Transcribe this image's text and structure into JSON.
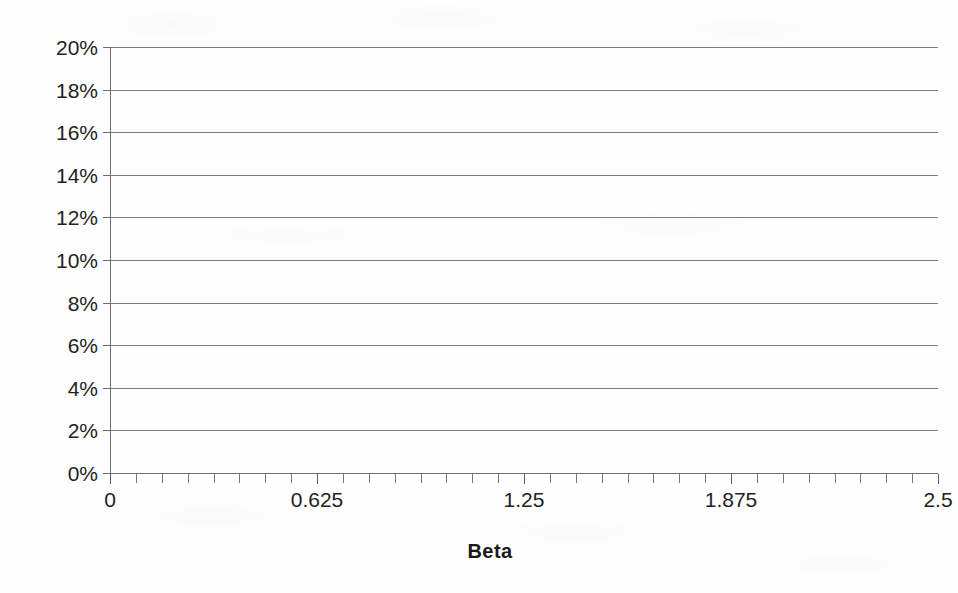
{
  "chart_data": {
    "type": "line",
    "title": "",
    "subtitle": "",
    "xlabel": "Beta",
    "ylabel": "",
    "xlim": [
      0,
      2.5
    ],
    "ylim": [
      0,
      0.2
    ],
    "grid": true,
    "grid_orientation": "horizontal",
    "legend": null,
    "legend_position": "none",
    "series": [],
    "x": [],
    "values": [],
    "note": "Plot area is empty — axes and horizontal gridlines only, no data rendered",
    "y_ticks": [
      {
        "value": 0.2,
        "label": "20%"
      },
      {
        "value": 0.18,
        "label": "18%"
      },
      {
        "value": 0.16,
        "label": "16%"
      },
      {
        "value": 0.14,
        "label": "14%"
      },
      {
        "value": 0.12,
        "label": "12%"
      },
      {
        "value": 0.1,
        "label": "10%"
      },
      {
        "value": 0.08,
        "label": "8%"
      },
      {
        "value": 0.06,
        "label": "6%"
      },
      {
        "value": 0.04,
        "label": "4%"
      },
      {
        "value": 0.02,
        "label": "2%"
      },
      {
        "value": 0.0,
        "label": "0%"
      }
    ],
    "x_ticks": [
      {
        "value": 0,
        "label": "0"
      },
      {
        "value": 0.625,
        "label": "0.625"
      },
      {
        "value": 1.25,
        "label": "1.25"
      },
      {
        "value": 1.875,
        "label": "1.875"
      },
      {
        "value": 2.5,
        "label": "2.5"
      }
    ],
    "x_minor_tick_count": 32,
    "colors": {
      "background": "#fefefe",
      "gridline": "#7d7d7d",
      "axis": "#6e6e6e",
      "tick": "#787878",
      "text": "#231f20",
      "title_text": "#1a1a1a"
    }
  }
}
